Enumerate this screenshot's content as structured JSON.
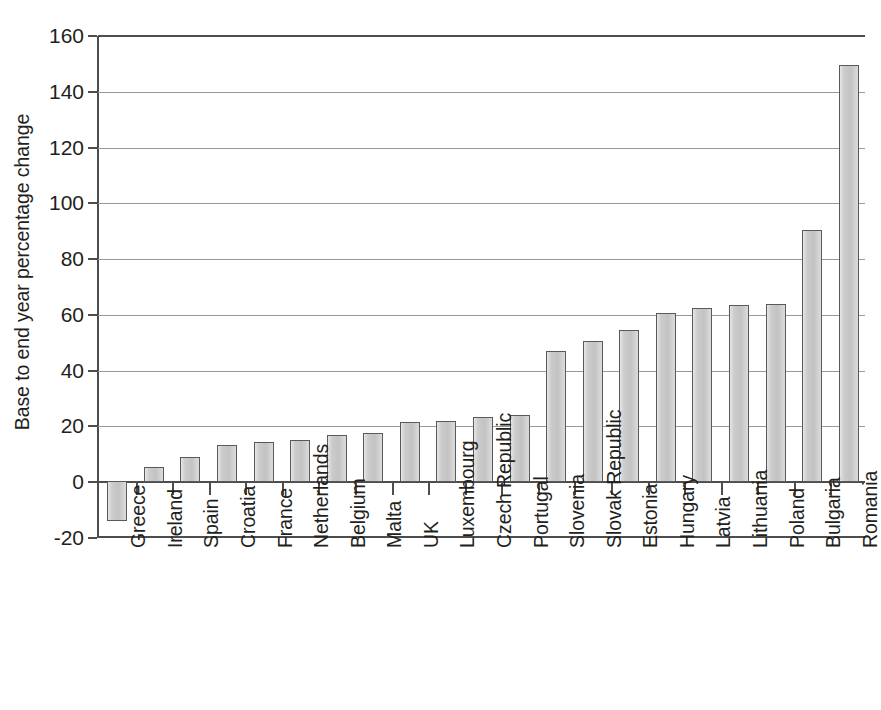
{
  "chart_data": {
    "type": "bar",
    "title": "",
    "subtitle": "",
    "xlabel": "",
    "ylabel": "Base to end year percentage change",
    "ylim": [
      -20,
      160
    ],
    "ytick_labels": [
      "160",
      "140",
      "120",
      "100",
      "80",
      "60",
      "40",
      "20",
      "0",
      "-20"
    ],
    "ytick_values": [
      160,
      140,
      120,
      100,
      80,
      60,
      40,
      20,
      0,
      -20
    ],
    "grid": true,
    "grid_axis": "y",
    "legend": false,
    "legend_position": "none",
    "bar_color": "#c9c9c9",
    "bar_edge_color": "#595959",
    "axis_color": "#4d4d4d",
    "gridline_color": "#999999",
    "categories": [
      "Greece",
      "Ireland",
      "Spain",
      "Croatia",
      "France",
      "Netherlands",
      "Belgium",
      "Malta",
      "UK",
      "Luxembourg",
      "Czech Republic",
      "Portugal",
      "Slovenia",
      "Slovak Republic",
      "Estonia",
      "Hungary",
      "Latvia",
      "Lithuania",
      "Poland",
      "Bulgaria",
      "Romania"
    ],
    "values": [
      -14.0,
      5.5,
      9.0,
      13.5,
      14.5,
      15.0,
      17.0,
      17.5,
      21.5,
      22.0,
      23.5,
      24.0,
      47.0,
      50.5,
      54.5,
      60.5,
      62.5,
      63.5,
      64.0,
      90.5,
      149.5
    ]
  }
}
